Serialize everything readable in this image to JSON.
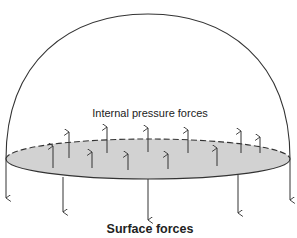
{
  "diagram": {
    "type": "hemisphere-force-diagram",
    "labels": {
      "internal": "Internal pressure forces",
      "surface": "Surface forces"
    },
    "colors": {
      "stroke": "#333333",
      "disc_fill": "#d2d2d2",
      "text": "#222222"
    },
    "dome": {
      "left_x": 6,
      "right_x": 290,
      "base_y": 159,
      "top_y": 14
    },
    "disc": {
      "cx": 148,
      "cy": 159,
      "rx": 142,
      "ry": 20,
      "top_edge": "dashed",
      "bottom_edge": "solid"
    },
    "internal_arrows": [
      {
        "x": 53,
        "y1": 168,
        "y2": 146
      },
      {
        "x": 69,
        "y1": 158,
        "y2": 132
      },
      {
        "x": 92,
        "y1": 168,
        "y2": 152
      },
      {
        "x": 107,
        "y1": 153,
        "y2": 127
      },
      {
        "x": 128,
        "y1": 170,
        "y2": 154
      },
      {
        "x": 148,
        "y1": 152,
        "y2": 128
      },
      {
        "x": 168,
        "y1": 169,
        "y2": 154
      },
      {
        "x": 188,
        "y1": 153,
        "y2": 130
      },
      {
        "x": 217,
        "y1": 166,
        "y2": 148
      },
      {
        "x": 241,
        "y1": 153,
        "y2": 131
      },
      {
        "x": 260,
        "y1": 153,
        "y2": 137
      }
    ],
    "surface_arrows": [
      {
        "x": 6,
        "y1": 159,
        "y2": 198
      },
      {
        "x": 63,
        "y1": 177,
        "y2": 212
      },
      {
        "x": 148,
        "y1": 179,
        "y2": 220
      },
      {
        "x": 238,
        "y1": 175,
        "y2": 213
      },
      {
        "x": 290,
        "y1": 159,
        "y2": 200
      }
    ]
  }
}
